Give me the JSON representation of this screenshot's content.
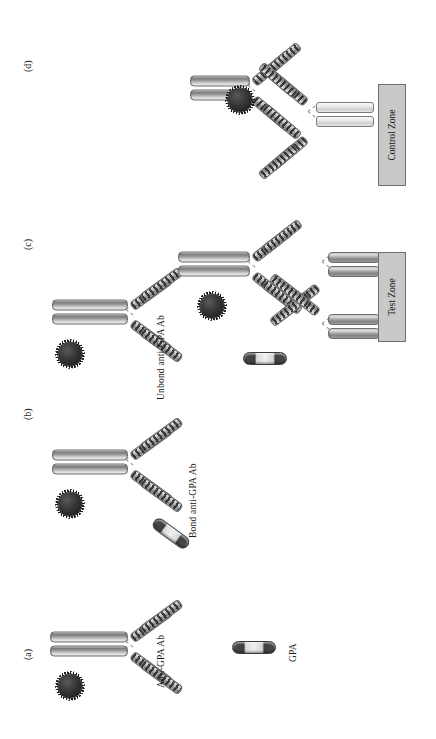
{
  "figure": {
    "orientation": "rotated-90",
    "background": "#ffffff"
  },
  "panels": [
    {
      "id": "a",
      "tag": "(a)",
      "label": "Anti-GPA Ab"
    },
    {
      "id": "b",
      "tag": "(b)",
      "label_top": "Bond anti-GPA Ab",
      "label_bottom": "Unbond anti-GPA Ab"
    },
    {
      "id": "c",
      "tag": "(c)",
      "zone": "Test Zone"
    },
    {
      "id": "d",
      "tag": "(d)",
      "zone": "Control Zone"
    }
  ],
  "legend": {
    "items": [
      {
        "name": "GPA",
        "label": "GPA",
        "shape": "capsule",
        "colors": [
          "#434343",
          "#e6e6e6",
          "#434343"
        ]
      }
    ]
  },
  "labels": {
    "anti_gpa_ab": "Anti-GPA Ab",
    "bond_anti_gpa_ab": "Bond anti-GPA Ab",
    "unbond_anti_gpa_ab": "Unbond anti-GPA Ab",
    "test_zone": "Test Zone",
    "control_zone": "Control Zone",
    "gpa": "GPA",
    "tag_a": "(a)",
    "tag_b": "(b)",
    "tag_c": "(c)",
    "tag_d": "(d)"
  },
  "colors": {
    "nanoparticle": "#262626",
    "antibody_light": "#d2d2d2",
    "antibody_dark": "#7e7e7e",
    "stripe": "#232323",
    "zone_fill": "#c9c9c9",
    "zone_border": "#6e6e6e",
    "gpa_dark": "#434343",
    "gpa_light": "#e6e6e6",
    "text": "#1a1a1a"
  },
  "elements": {
    "antibody_name": "igg-antibody",
    "nanoparticle_name": "gold-nanoparticle",
    "gpa_name": "gpa-antigen",
    "hinge_name": "antibody-hinge"
  }
}
